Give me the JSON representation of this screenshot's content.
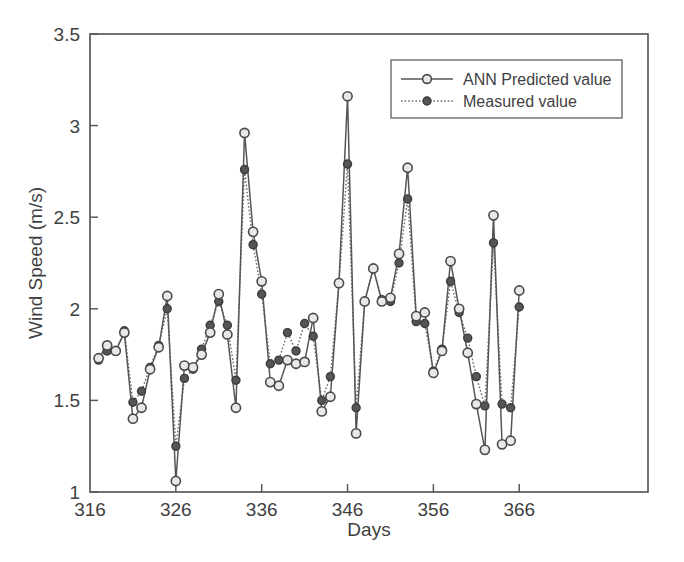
{
  "chart_data": {
    "type": "line",
    "title": "",
    "xlabel": "Days",
    "ylabel": "Wind Speed (m/s)",
    "xlim": [
      316,
      381
    ],
    "ylim": [
      1,
      3.5
    ],
    "xticks": [
      316,
      326,
      336,
      346,
      356,
      366
    ],
    "yticks": [
      1,
      1.5,
      2,
      2.5,
      3,
      3.5
    ],
    "xtick_labels": [
      "316",
      "326",
      "336",
      "346",
      "356",
      "366"
    ],
    "ytick_labels": [
      "1",
      "1.5",
      "2",
      "2.5",
      "3",
      "3.5"
    ],
    "grid": false,
    "legend_position": "top-right",
    "x": [
      317,
      318,
      319,
      320,
      321,
      322,
      323,
      324,
      325,
      326,
      327,
      328,
      329,
      330,
      331,
      332,
      333,
      334,
      335,
      336,
      337,
      338,
      339,
      340,
      341,
      342,
      343,
      344,
      345,
      346,
      347,
      348,
      349,
      350,
      351,
      352,
      353,
      354,
      355,
      356,
      357,
      358,
      359,
      360,
      361,
      362,
      363,
      364,
      365,
      366
    ],
    "series": [
      {
        "name": "ANN Predicted value",
        "marker": "open-circle",
        "linestyle": "solid",
        "color": "#565656",
        "values": [
          1.73,
          1.8,
          1.77,
          1.87,
          1.4,
          1.46,
          1.67,
          1.79,
          2.07,
          1.06,
          1.69,
          1.68,
          1.75,
          1.87,
          2.08,
          1.86,
          1.46,
          2.96,
          2.42,
          2.15,
          1.6,
          1.58,
          1.72,
          1.7,
          1.71,
          1.95,
          1.44,
          1.52,
          2.14,
          3.16,
          1.32,
          2.04,
          2.22,
          2.04,
          2.06,
          2.3,
          2.77,
          1.96,
          1.98,
          1.65,
          1.77,
          2.26,
          2.0,
          1.76,
          1.48,
          1.23,
          2.51,
          1.26,
          1.28,
          2.1
        ]
      },
      {
        "name": "Measured value",
        "marker": "filled-circle",
        "linestyle": "dotted",
        "color": "#555555",
        "values": [
          1.72,
          1.77,
          1.77,
          1.88,
          1.49,
          1.55,
          1.68,
          1.8,
          2.0,
          1.25,
          1.62,
          1.67,
          1.78,
          1.91,
          2.04,
          1.91,
          1.61,
          2.76,
          2.35,
          2.08,
          1.7,
          1.72,
          1.87,
          1.77,
          1.92,
          1.85,
          1.5,
          1.63,
          2.14,
          2.79,
          1.46,
          2.04,
          2.22,
          2.05,
          2.04,
          2.25,
          2.6,
          1.93,
          1.92,
          1.66,
          1.78,
          2.15,
          1.98,
          1.84,
          1.63,
          1.47,
          2.36,
          1.48,
          1.46,
          2.01
        ]
      }
    ]
  },
  "legend": {
    "entries": [
      {
        "label": "ANN Predicted value"
      },
      {
        "label": "Measured value"
      }
    ]
  },
  "colors": {
    "axis": "#5a5a5a",
    "predicted": "#565656",
    "measured": "#555555",
    "background": "#ffffff"
  }
}
